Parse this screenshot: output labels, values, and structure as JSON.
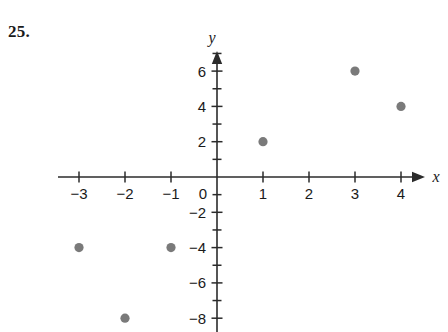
{
  "problem": {
    "number": "25."
  },
  "chart_data": {
    "type": "scatter",
    "title": "",
    "xlabel": "x",
    "ylabel": "y",
    "xlim": [
      -3.6,
      4.7
    ],
    "ylim": [
      -8.8,
      7.0
    ],
    "grid": false,
    "legend": null,
    "point_color": "#7a7a7a",
    "axis_color": "#2b2b2b",
    "x_ticks": [
      -3,
      -2,
      -1,
      0,
      1,
      2,
      3,
      4
    ],
    "x_tick_labels": [
      "−3",
      "−2",
      "−1",
      "0",
      "1",
      "2",
      "3",
      "4"
    ],
    "y_ticks": [
      6,
      4,
      2,
      0,
      -2,
      -4,
      -6,
      -8
    ],
    "y_tick_labels": [
      "6",
      "4",
      "2",
      "0",
      "−2",
      "−4",
      "−6",
      "−8"
    ],
    "y_minor_ticks": [
      7,
      5,
      3,
      1,
      -1,
      -3,
      -5,
      -7
    ],
    "points": [
      {
        "x": 1,
        "y": 2,
        "label": "(1, 2)"
      },
      {
        "x": 3,
        "y": 6,
        "label": "(3, 6)"
      },
      {
        "x": 4,
        "y": 4,
        "label": "(4, 4)"
      },
      {
        "x": -1,
        "y": -4,
        "label": "(-1, -4)"
      },
      {
        "x": -3,
        "y": -4,
        "label": "(-3, -4)"
      },
      {
        "x": -2,
        "y": -8,
        "label": "(-2, -8)"
      }
    ]
  },
  "geometry": {
    "origin_x": 217,
    "origin_y": 177,
    "unit_x": 46,
    "unit_y": 17.65,
    "x_axis_start": 58,
    "x_axis_end": 425,
    "y_axis_top": 51,
    "y_axis_bottom": 332,
    "point_radius": 4.6
  }
}
